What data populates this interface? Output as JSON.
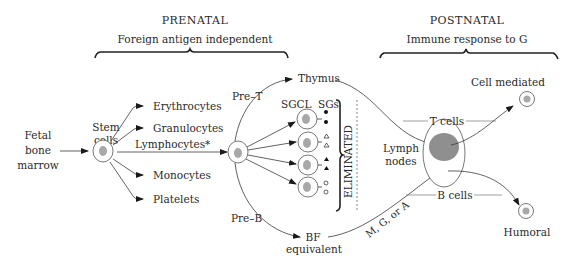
{
  "sections": {
    "prenatal": {
      "title": "PRENATAL",
      "subtitle": "Foreign antigen independent"
    },
    "postnatal": {
      "title": "POSTNATAL",
      "subtitle": "Immune response to G"
    }
  },
  "source": {
    "line1": "Fetal",
    "line2": "bone",
    "line3": "marrow"
  },
  "stem_cells": {
    "line1": "Stem",
    "line2": "cells"
  },
  "lineages": [
    {
      "label": "Erythrocytes"
    },
    {
      "label": "Granulocytes"
    },
    {
      "label": "Lymphocytes*"
    },
    {
      "label": "Monocytes"
    },
    {
      "label": "Platelets"
    }
  ],
  "precursors": {
    "pre_t": "Pre–T",
    "pre_b": "Pre–B"
  },
  "thymus": "Thymus",
  "clone_headers": {
    "sgcl": "SGCL",
    "sgs": "SGs"
  },
  "clone_markers": [
    "filled-circle",
    "open-triangle",
    "filled-triangle",
    "open-circle"
  ],
  "eliminated": "ELIMINATED",
  "bf": {
    "line1": "BF",
    "line2": "equivalent"
  },
  "immunoglobulin": "M, G, or A",
  "lymph_nodes": {
    "line1": "Lymph",
    "line2": "nodes"
  },
  "t_cells": "T cells",
  "b_cells": "B cells",
  "outcomes": {
    "cell_mediated": "Cell mediated",
    "humoral": "Humoral"
  },
  "colors": {
    "ink": "#2a2a2a",
    "cell_nucleus": "#a8a8a8",
    "lymph_core": "#8f8f8f"
  }
}
